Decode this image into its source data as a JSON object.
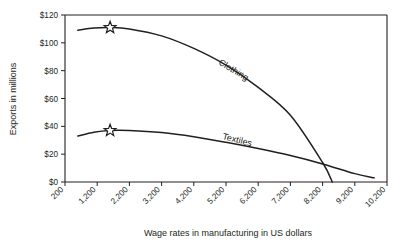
{
  "chart_data": {
    "type": "line",
    "title": "",
    "xlabel": "Wage rates in manufacturing in US dollars",
    "ylabel": "Exports in millions",
    "xlim": [
      200,
      10200
    ],
    "ylim": [
      0,
      120
    ],
    "grid": false,
    "legend_position": "inline-labels",
    "x_tick_labels": [
      "200",
      "1,200",
      "2,200",
      "3,200",
      "4,200",
      "5,200",
      "6,200",
      "7,200",
      "8,200",
      "9,200",
      "10,200"
    ],
    "x_ticks": [
      200,
      1200,
      2200,
      3200,
      4200,
      5200,
      6200,
      7200,
      8200,
      9200,
      10200
    ],
    "y_tick_labels": [
      "$0",
      "$20",
      "$40",
      "$60",
      "$80",
      "$100",
      "$120"
    ],
    "y_ticks": [
      0,
      20,
      40,
      60,
      80,
      100,
      120
    ],
    "series": [
      {
        "name": "Clothing",
        "label": "Clothing",
        "marker": "star",
        "marker_point": {
          "x": 1600,
          "y": 111
        },
        "x": [
          600,
          1100,
          1600,
          2200,
          3200,
          4200,
          5200,
          6200,
          7200,
          8200,
          8500
        ],
        "values": [
          109,
          110.6,
          111,
          110,
          105,
          96,
          84,
          68,
          48,
          14,
          0
        ]
      },
      {
        "name": "Textiles",
        "label": "Textiles",
        "marker": "star",
        "marker_point": {
          "x": 1600,
          "y": 37
        },
        "x": [
          600,
          1100,
          1600,
          2200,
          3200,
          4200,
          5200,
          6200,
          7200,
          8200,
          9200,
          9800
        ],
        "values": [
          33,
          35.8,
          37,
          37,
          35.5,
          32.5,
          28.5,
          24,
          19,
          13,
          6,
          3
        ]
      }
    ]
  },
  "axis_titles": {
    "x": "Wage rates in manufacturing in US dollars",
    "y": "Exports in millions"
  },
  "colors": {
    "ink": "#231f20",
    "background": "#ffffff",
    "marker_fill": "#ffffff"
  }
}
